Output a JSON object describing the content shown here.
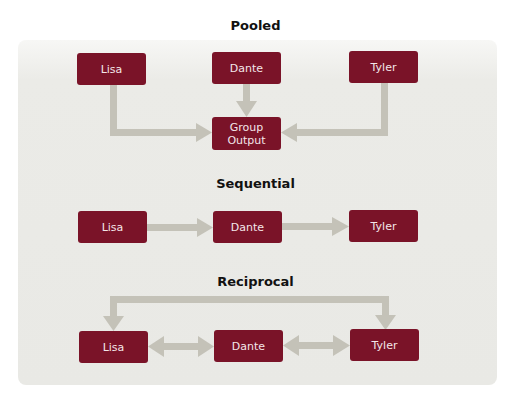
{
  "colors": {
    "box": "#7a1328",
    "box_text": "#f3e6e8",
    "arrow": "#c4c2b8",
    "panel": "#ebebe7"
  },
  "sections": [
    {
      "title": "Pooled",
      "nodes": [
        "Lisa",
        "Dante",
        "Tyler"
      ],
      "output": "Group Output",
      "edges": [
        {
          "from": "Lisa",
          "to": "Group Output",
          "type": "one-way"
        },
        {
          "from": "Dante",
          "to": "Group Output",
          "type": "one-way"
        },
        {
          "from": "Tyler",
          "to": "Group Output",
          "type": "one-way"
        }
      ]
    },
    {
      "title": "Sequential",
      "nodes": [
        "Lisa",
        "Dante",
        "Tyler"
      ],
      "edges": [
        {
          "from": "Lisa",
          "to": "Dante",
          "type": "one-way"
        },
        {
          "from": "Dante",
          "to": "Tyler",
          "type": "one-way"
        }
      ]
    },
    {
      "title": "Reciprocal",
      "nodes": [
        "Lisa",
        "Dante",
        "Tyler"
      ],
      "edges": [
        {
          "from": "Lisa",
          "to": "Dante",
          "type": "two-way"
        },
        {
          "from": "Dante",
          "to": "Tyler",
          "type": "two-way"
        },
        {
          "from": "Lisa",
          "to": "Tyler",
          "type": "two-way",
          "route": "over-top"
        }
      ]
    }
  ]
}
